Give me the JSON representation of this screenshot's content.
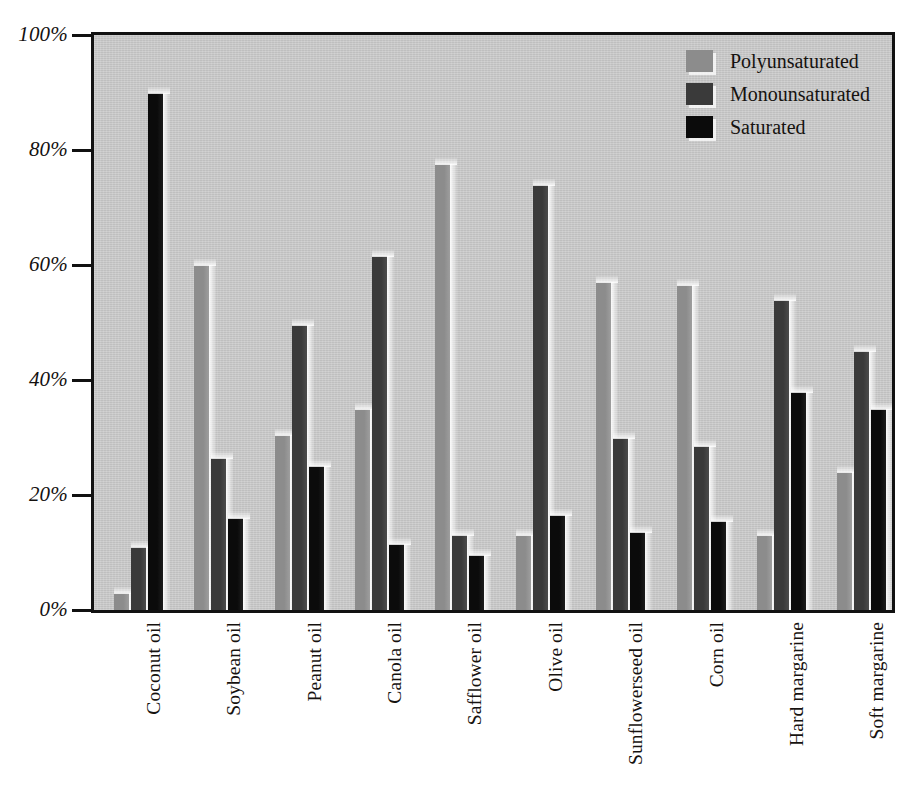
{
  "chart_data": {
    "type": "bar",
    "title": "",
    "subtitle": "",
    "xlabel": "",
    "ylabel": "",
    "ylim": [
      0,
      100
    ],
    "y_tick_labels": [
      "0%",
      "20%",
      "40%",
      "60%",
      "80%",
      "100%"
    ],
    "y_ticks": [
      0,
      20,
      40,
      60,
      80,
      100
    ],
    "grid": false,
    "legend_position": "top-right",
    "categories": [
      "Coconut oil",
      "Soybean oil",
      "Peanut oil",
      "Canola oil",
      "Safflower oil",
      "Olive oil",
      "Sunflowerseed oil",
      "Corn oil",
      "Hard margarine",
      "Soft margarine"
    ],
    "series": [
      {
        "name": "Polyunsaturated",
        "color": "#8c8c8c",
        "values": [
          3,
          60,
          30.5,
          35,
          77.5,
          13,
          57,
          56.5,
          13,
          24
        ]
      },
      {
        "name": "Monounsaturated",
        "color": "#3a3a3a",
        "values": [
          11,
          26.5,
          49.5,
          61.5,
          13,
          74,
          30,
          28.5,
          54,
          45
        ]
      },
      {
        "name": "Saturated",
        "color": "#0b0b0b",
        "values": [
          90,
          16,
          25,
          11.5,
          9.5,
          16.5,
          13.5,
          15.5,
          38,
          35
        ]
      }
    ]
  },
  "legend": {
    "entries": [
      {
        "label": "Polyunsaturated",
        "color": "#8c8c8c"
      },
      {
        "label": "Monounsaturated",
        "color": "#3a3a3a"
      },
      {
        "label": "Saturated",
        "color": "#0b0b0b"
      }
    ]
  },
  "colors": {
    "plot_background": "#c9c9c9",
    "page_background": "#ffffff",
    "axis": "#111111",
    "text": "#15120f"
  }
}
